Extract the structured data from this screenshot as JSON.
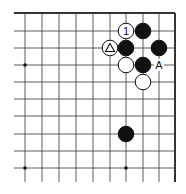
{
  "diagram": {
    "grid": {
      "x_lines": [
        25,
        42,
        59,
        76,
        93,
        110,
        126,
        143,
        159,
        175
      ],
      "y_lines": [
        13,
        31,
        48,
        65,
        82,
        99,
        116,
        134,
        151,
        168
      ],
      "edges": [
        "top",
        "right"
      ]
    },
    "star_points": [
      {
        "col": 0,
        "row": 3
      },
      {
        "col": 0,
        "row": 9
      },
      {
        "col": 6,
        "row": 9
      }
    ],
    "stones": [
      {
        "color": "white",
        "col": 6,
        "row": 1,
        "label": "1"
      },
      {
        "color": "black",
        "col": 7,
        "row": 1,
        "label": ""
      },
      {
        "color": "white",
        "col": 5,
        "row": 2,
        "label": "△"
      },
      {
        "color": "black",
        "col": 6,
        "row": 2,
        "label": ""
      },
      {
        "color": "black",
        "col": 8,
        "row": 2,
        "label": ""
      },
      {
        "color": "white",
        "col": 6,
        "row": 3,
        "label": ""
      },
      {
        "color": "black",
        "col": 7,
        "row": 3,
        "label": ""
      },
      {
        "color": "white",
        "col": 7,
        "row": 4,
        "label": ""
      },
      {
        "color": "black",
        "col": 6,
        "row": 7,
        "label": ""
      }
    ],
    "point_labels": [
      {
        "col": 8,
        "row": 3,
        "text": "A"
      }
    ]
  }
}
